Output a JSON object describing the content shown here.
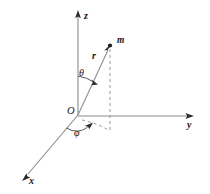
{
  "figure": {
    "type": "spherical-coordinate-diagram",
    "background_color": "#ffffff",
    "line_color": "#8a8a8a",
    "label_color": "#161616"
  },
  "axes": {
    "z": {
      "label": "z",
      "direction": "up",
      "arrow": "arrowhead-up",
      "origin_px": [
        78,
        115
      ],
      "tip_px": [
        78,
        14
      ]
    },
    "y": {
      "label": "y",
      "direction": "right",
      "arrow": "arrowhead-right",
      "origin_px": [
        78,
        116
      ],
      "tip_px": [
        192,
        116
      ]
    },
    "x": {
      "label": "x",
      "direction": "down-left",
      "arrow": "arrowhead-down-left",
      "origin_px": [
        78,
        115
      ],
      "tip_px": [
        24,
        179
      ]
    }
  },
  "origin": {
    "label": "O",
    "px": [
      78,
      115
    ]
  },
  "vector": {
    "label": "r",
    "description": "position vector from origin to point m",
    "arrow": "arrowhead",
    "from_px": [
      78,
      115
    ],
    "to_px": [
      110,
      46
    ]
  },
  "point": {
    "label": "m",
    "description": "mass point at tip of r",
    "px": [
      110,
      46
    ]
  },
  "angles": [
    {
      "label": "θ",
      "name": "theta",
      "description": "polar angle measured from z-axis to r",
      "arc_center_px": [
        78,
        115
      ],
      "arc_radius_px": 40
    },
    {
      "label": "φ",
      "name": "phi",
      "description": "azimuthal angle measured from x-axis to projection of r in xy-plane",
      "arc_center_px": [
        78,
        115
      ],
      "arc_radius_px": 17
    }
  ],
  "construction_lines": [
    {
      "name": "vertical-drop-from-m",
      "style": "dashed",
      "from_px": [
        110,
        48
      ],
      "to_px": [
        110,
        133
      ]
    },
    {
      "name": "projection-in-xy-plane",
      "style": "dashed",
      "from_px": [
        80,
        120
      ],
      "to_px": [
        110,
        131
      ]
    }
  ]
}
